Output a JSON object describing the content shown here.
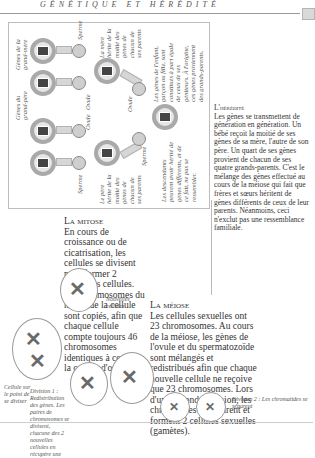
{
  "header": {
    "running_title": "GÉNÉTIQUE ET HÉRÉDITÉ"
  },
  "diagram": {
    "labels": {
      "genes_grandmother_1": "Gènes de la grand-mère",
      "genes_grandfather_1": "Gènes du grand-père",
      "genes_grandmother_2": "Gènes de la grand-mère",
      "genes_grandfather_2": "Gènes du grand-père",
      "ovule_1": "Ovule",
      "ovule_2": "Ovule",
      "ovule_3": "Ovule",
      "sperme_1": "Sperme",
      "sperme_2": "Sperme",
      "sperme_3": "Sperme",
      "mother_caption": "La mère hérite de la moitié des gènes de chacun de ses parents",
      "father_caption": "Le père hérite de la moitié des gènes de chacun de ses parents",
      "child_caption": "Les gènes de l'enfant, garçon ou fille, sont constitués à part égale de ceux de ses géniteurs. À l'origine, ces gènes proviennent des grands-parents.",
      "descendants_caption": "Les descendants peuvent avoir hérité de gènes différents, et de ce fait, ne pas se ressembler."
    }
  },
  "heredity": {
    "title": "L'hérédité",
    "body": "Les gènes se transmettent de génération en génération. Un bébé reçoit la moitié de ses gènes de sa mère, l'autre de son père. Un quart de ses gènes provient de chacun de ses quatre grands-parents. C'est le mélange des gènes effectué au cours de la méiose qui fait que frères et sœurs héritent de gènes différents de ceux de leur parents. Néanmoins, ceci n'exclut pas une ressemblance familiale."
  },
  "mitosis": {
    "title": "La mitose",
    "body": "En cours de croissance ou de cicatrisation, les cellules se divisent pour former 2 nouvelles cellules. Les chromosomes du noyau de la cellule sont copiés, afin que chaque cellule compte toujours 46 chromosomes identiques à ceux de la cellule d'origine.",
    "caption_dividing": "Cellule sur le point de se diviser",
    "caption_new_cells": "Nouvelles cellules"
  },
  "meiosis": {
    "title": "La méiose",
    "body": "Les cellules sexuelles ont 23 chromosomes. Au cours de la méiose, les gènes de l'ovule et du spermatozoïde sont mélangés et redistribués afin que chaque nouvelle cellule ne reçoive que 23 chromosomes. Lors d'une seconde division, les chromatides se séparent et forment 2 cellules sexuelles (gamètes).",
    "caption_division1": "Division 1 : Redistribution des gènes. Les paires de chromosomes se divisent, chacune des 2 nouvelles cellules en récupère une",
    "caption_division2": "Division 2 : Les chromatides se séparent"
  }
}
